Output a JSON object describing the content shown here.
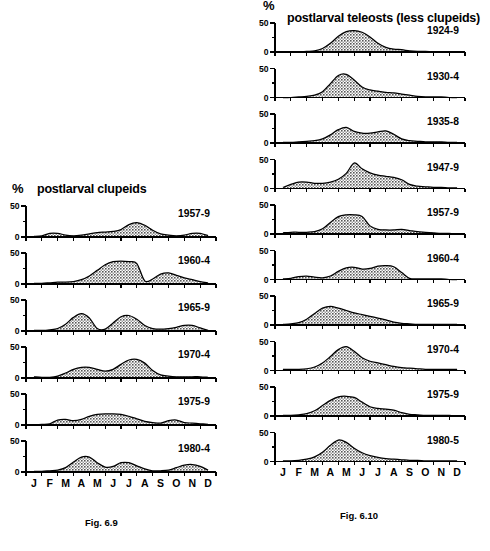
{
  "figure": {
    "background": "#ffffff",
    "ink": "#000000",
    "fill_pattern": "checkered-gray-stipple",
    "fill_color": "#8f8f8f"
  },
  "months": [
    "J",
    "F",
    "M",
    "A",
    "M",
    "J",
    "J",
    "A",
    "S",
    "O",
    "N",
    "D"
  ],
  "y_axis": {
    "min": 0,
    "max": 50,
    "labels": [
      "0",
      "50"
    ],
    "label_values": [
      0,
      50
    ],
    "minor_tick_values": [
      25
    ],
    "unit": "%"
  },
  "left_panel": {
    "percent_symbol": "%",
    "title": "postlarval clupeids",
    "caption": "Fig. 6.9",
    "charts": [
      {
        "label": "1957-9"
      },
      {
        "label": "1960-4"
      },
      {
        "label": "1965-9"
      },
      {
        "label": "1970-4"
      },
      {
        "label": "1975-9"
      },
      {
        "label": "1980-4"
      }
    ]
  },
  "right_panel": {
    "percent_symbol": "%",
    "title": "postlarval teleosts (less clupeids)",
    "caption": "Fig. 6.10",
    "charts": [
      {
        "label": "1924-9"
      },
      {
        "label": "1930-4"
      },
      {
        "label": "1935-8"
      },
      {
        "label": "1947-9"
      },
      {
        "label": "1957-9"
      },
      {
        "label": "1960-4"
      },
      {
        "label": "1965-9"
      },
      {
        "label": "1970-4"
      },
      {
        "label": "1975-9"
      },
      {
        "label": "1980-5"
      }
    ]
  },
  "chart_data": [
    {
      "type": "area",
      "id": "clupeids-1957-9",
      "title": "postlarval clupeids 1957-9",
      "xlabel": "",
      "ylabel": "%",
      "ylim": [
        0,
        50
      ],
      "grid": false,
      "legend": "none",
      "categories": [
        "J",
        "F",
        "M",
        "A",
        "M",
        "J",
        "J",
        "A",
        "S",
        "O",
        "N",
        "D"
      ],
      "x": [
        0,
        0.5,
        1,
        1.5,
        2,
        2.5,
        3,
        3.5,
        4,
        4.5,
        5,
        5.5,
        6,
        6.5,
        7,
        7.5,
        8,
        8.5,
        9,
        9.5,
        10,
        10.5,
        11
      ],
      "values": [
        1,
        2,
        6,
        6,
        3,
        2,
        3,
        5,
        7,
        8,
        9,
        12,
        20,
        23,
        19,
        11,
        5,
        3,
        2,
        3,
        6,
        6,
        2
      ]
    },
    {
      "type": "area",
      "id": "clupeids-1960-4",
      "title": "postlarval clupeids 1960-4",
      "xlabel": "",
      "ylabel": "%",
      "ylim": [
        0,
        50
      ],
      "grid": false,
      "legend": "none",
      "categories": [
        "J",
        "F",
        "M",
        "A",
        "M",
        "J",
        "J",
        "A",
        "S",
        "O",
        "N",
        "D"
      ],
      "x": [
        0,
        0.5,
        1,
        1.5,
        2,
        2.5,
        3,
        3.5,
        4,
        4.5,
        5,
        5.5,
        6,
        6.5,
        7,
        7.5,
        8,
        8.5,
        9,
        9.5,
        10,
        10.5,
        11
      ],
      "values": [
        1,
        1,
        2,
        3,
        3,
        4,
        7,
        13,
        22,
        31,
        36,
        37,
        36,
        33,
        5,
        8,
        16,
        18,
        14,
        10,
        7,
        4,
        2
      ]
    },
    {
      "type": "area",
      "id": "clupeids-1965-9",
      "title": "postlarval clupeids 1965-9",
      "xlabel": "",
      "ylabel": "%",
      "ylim": [
        0,
        50
      ],
      "grid": false,
      "legend": "none",
      "categories": [
        "J",
        "F",
        "M",
        "A",
        "M",
        "J",
        "J",
        "A",
        "S",
        "O",
        "N",
        "D"
      ],
      "x": [
        0,
        0.5,
        1,
        1.5,
        2,
        2.5,
        3,
        3.5,
        4,
        4.5,
        5,
        5.5,
        6,
        6.5,
        7,
        7.5,
        8,
        8.5,
        9,
        9.5,
        10,
        10.5,
        11
      ],
      "values": [
        1,
        1,
        2,
        4,
        11,
        22,
        28,
        21,
        4,
        3,
        13,
        23,
        25,
        19,
        9,
        4,
        3,
        4,
        6,
        9,
        9,
        5,
        1
      ]
    },
    {
      "type": "area",
      "id": "clupeids-1970-4",
      "title": "postlarval clupeids 1970-4",
      "xlabel": "",
      "ylabel": "%",
      "ylim": [
        0,
        50
      ],
      "grid": false,
      "legend": "none",
      "categories": [
        "J",
        "F",
        "M",
        "A",
        "M",
        "J",
        "J",
        "A",
        "S",
        "O",
        "N",
        "D"
      ],
      "x": [
        0,
        0.5,
        1,
        1.5,
        2,
        2.5,
        3,
        3.5,
        4,
        4.5,
        5,
        5.5,
        6,
        6.5,
        7,
        7.5,
        8,
        8.5,
        9,
        9.5,
        10,
        10.5,
        11
      ],
      "values": [
        2,
        1,
        1,
        3,
        8,
        14,
        17,
        17,
        14,
        11,
        14,
        22,
        29,
        30,
        24,
        12,
        5,
        3,
        2,
        2,
        2,
        2,
        1
      ]
    },
    {
      "type": "area",
      "id": "clupeids-1975-9",
      "title": "postlarval clupeids 1975-9",
      "xlabel": "",
      "ylabel": "%",
      "ylim": [
        0,
        50
      ],
      "grid": false,
      "legend": "none",
      "categories": [
        "J",
        "F",
        "M",
        "A",
        "M",
        "J",
        "J",
        "A",
        "S",
        "O",
        "N",
        "D"
      ],
      "x": [
        0,
        0.5,
        1,
        1.5,
        2,
        2.5,
        3,
        3.5,
        4,
        4.5,
        5,
        5.5,
        6,
        6.5,
        7,
        7.5,
        8,
        8.5,
        9,
        9.5,
        10,
        10.5,
        11
      ],
      "values": [
        0,
        1,
        2,
        8,
        9,
        7,
        9,
        14,
        17,
        18,
        18,
        17,
        14,
        10,
        6,
        4,
        3,
        7,
        8,
        4,
        3,
        2,
        1
      ]
    },
    {
      "type": "area",
      "id": "clupeids-1980-4",
      "title": "postlarval clupeids 1980-4",
      "xlabel": "",
      "ylabel": "%",
      "ylim": [
        0,
        50
      ],
      "grid": false,
      "legend": "none",
      "categories": [
        "J",
        "F",
        "M",
        "A",
        "M",
        "J",
        "J",
        "A",
        "S",
        "O",
        "N",
        "D"
      ],
      "x": [
        0,
        0.5,
        1,
        1.5,
        2,
        2.5,
        3,
        3.5,
        4,
        4.5,
        5,
        5.5,
        6,
        6.5,
        7,
        7.5,
        8,
        8.5,
        9,
        9.5,
        10,
        10.5,
        11
      ],
      "values": [
        1,
        1,
        2,
        3,
        7,
        16,
        24,
        24,
        15,
        8,
        9,
        15,
        15,
        10,
        5,
        2,
        2,
        3,
        7,
        11,
        12,
        9,
        3
      ]
    },
    {
      "type": "area",
      "id": "teleosts-1924-9",
      "title": "postlarval teleosts (less clupeids) 1924-9",
      "xlabel": "",
      "ylabel": "%",
      "ylim": [
        0,
        50
      ],
      "grid": false,
      "legend": "none",
      "categories": [
        "J",
        "F",
        "M",
        "A",
        "M",
        "J",
        "J",
        "A",
        "S",
        "O",
        "N",
        "D"
      ],
      "x": [
        0,
        0.5,
        1,
        1.5,
        2,
        2.5,
        3,
        3.5,
        4,
        4.5,
        5,
        5.5,
        6,
        6.5,
        7,
        7.5,
        8,
        8.5,
        9,
        9.5,
        10,
        10.5,
        11
      ],
      "values": [
        0,
        0,
        0,
        1,
        2,
        6,
        15,
        27,
        35,
        37,
        34,
        26,
        15,
        8,
        5,
        4,
        2,
        1,
        1,
        0,
        0,
        0,
        0
      ]
    },
    {
      "type": "area",
      "id": "teleosts-1930-4",
      "title": "postlarval teleosts (less clupeids) 1930-4",
      "xlabel": "",
      "ylabel": "%",
      "ylim": [
        0,
        50
      ],
      "grid": false,
      "legend": "none",
      "categories": [
        "J",
        "F",
        "M",
        "A",
        "M",
        "J",
        "J",
        "A",
        "S",
        "O",
        "N",
        "D"
      ],
      "x": [
        0,
        0.5,
        1,
        1.5,
        2,
        2.5,
        3,
        3.5,
        4,
        4.5,
        5,
        5.5,
        6,
        6.5,
        7,
        7.5,
        8,
        8.5,
        9,
        9.5,
        10,
        10.5,
        11
      ],
      "values": [
        0,
        0,
        1,
        2,
        4,
        10,
        24,
        38,
        40,
        30,
        18,
        13,
        11,
        9,
        8,
        6,
        4,
        2,
        1,
        1,
        1,
        0,
        0
      ]
    },
    {
      "type": "area",
      "id": "teleosts-1935-8",
      "title": "postlarval teleosts (less clupeids) 1935-8",
      "xlabel": "",
      "ylabel": "%",
      "ylim": [
        0,
        50
      ],
      "grid": false,
      "legend": "none",
      "categories": [
        "J",
        "F",
        "M",
        "A",
        "M",
        "J",
        "J",
        "A",
        "S",
        "O",
        "N",
        "D"
      ],
      "x": [
        0,
        0.5,
        1,
        1.5,
        2,
        2.5,
        3,
        3.5,
        4,
        4.5,
        5,
        5.5,
        6,
        6.5,
        7,
        7.5,
        8,
        8.5,
        9,
        9.5,
        10,
        10.5,
        11
      ],
      "values": [
        1,
        1,
        2,
        3,
        4,
        7,
        14,
        23,
        27,
        20,
        17,
        17,
        19,
        21,
        15,
        7,
        4,
        3,
        2,
        2,
        2,
        1,
        1
      ]
    },
    {
      "type": "area",
      "id": "teleosts-1947-9",
      "title": "postlarval teleosts (less clupeids) 1947-9",
      "xlabel": "",
      "ylabel": "%",
      "ylim": [
        0,
        50
      ],
      "grid": false,
      "legend": "none",
      "categories": [
        "J",
        "F",
        "M",
        "A",
        "M",
        "J",
        "J",
        "A",
        "S",
        "O",
        "N",
        "D"
      ],
      "x": [
        0,
        0.5,
        1,
        1.5,
        2,
        2.5,
        3,
        3.5,
        4,
        4.5,
        5,
        5.5,
        6,
        6.5,
        7,
        7.5,
        8,
        8.5,
        9,
        9.5,
        10,
        10.5,
        11
      ],
      "values": [
        2,
        7,
        11,
        11,
        9,
        9,
        11,
        16,
        26,
        44,
        34,
        27,
        23,
        21,
        19,
        15,
        7,
        4,
        3,
        2,
        2,
        1,
        1
      ]
    },
    {
      "type": "area",
      "id": "teleosts-1957-9",
      "title": "postlarval teleosts (less clupeids) 1957-9",
      "xlabel": "",
      "ylabel": "%",
      "ylim": [
        0,
        50
      ],
      "grid": false,
      "legend": "none",
      "categories": [
        "J",
        "F",
        "M",
        "A",
        "M",
        "J",
        "J",
        "A",
        "S",
        "O",
        "N",
        "D"
      ],
      "x": [
        0,
        0.5,
        1,
        1.5,
        2,
        2.5,
        3,
        3.5,
        4,
        4.5,
        5,
        5.5,
        6,
        6.5,
        7,
        7.5,
        8,
        8.5,
        9,
        9.5,
        10,
        10.5,
        11
      ],
      "values": [
        2,
        3,
        3,
        3,
        4,
        9,
        20,
        30,
        33,
        33,
        30,
        14,
        8,
        7,
        7,
        8,
        6,
        4,
        3,
        2,
        1,
        1,
        0
      ]
    },
    {
      "type": "area",
      "id": "teleosts-1960-4",
      "title": "postlarval teleosts (less clupeids) 1960-4",
      "xlabel": "",
      "ylabel": "%",
      "ylim": [
        0,
        50
      ],
      "grid": false,
      "legend": "none",
      "categories": [
        "J",
        "F",
        "M",
        "A",
        "M",
        "J",
        "J",
        "A",
        "S",
        "O",
        "N",
        "D"
      ],
      "x": [
        0,
        0.5,
        1,
        1.5,
        2,
        2.5,
        3,
        3.5,
        4,
        4.5,
        5,
        5.5,
        6,
        6.5,
        7,
        7.5,
        8,
        8.5,
        9,
        9.5,
        10,
        10.5,
        11
      ],
      "values": [
        1,
        2,
        5,
        6,
        4,
        3,
        6,
        14,
        20,
        21,
        18,
        19,
        23,
        24,
        22,
        12,
        2,
        1,
        1,
        1,
        1,
        0,
        0
      ]
    },
    {
      "type": "area",
      "id": "teleosts-1965-9",
      "title": "postlarval teleosts (less clupeids) 1965-9",
      "xlabel": "",
      "ylabel": "%",
      "ylim": [
        0,
        50
      ],
      "grid": false,
      "legend": "none",
      "categories": [
        "J",
        "F",
        "M",
        "A",
        "M",
        "J",
        "J",
        "A",
        "S",
        "O",
        "N",
        "D"
      ],
      "x": [
        0,
        0.5,
        1,
        1.5,
        2,
        2.5,
        3,
        3.5,
        4,
        4.5,
        5,
        5.5,
        6,
        6.5,
        7,
        7.5,
        8,
        8.5,
        9,
        9.5,
        10,
        10.5,
        11
      ],
      "values": [
        1,
        2,
        4,
        10,
        20,
        29,
        32,
        29,
        25,
        21,
        18,
        15,
        12,
        9,
        5,
        3,
        2,
        1,
        1,
        1,
        1,
        1,
        1
      ]
    },
    {
      "type": "area",
      "id": "teleosts-1970-4",
      "title": "postlarval teleosts (less clupeids) 1970-4",
      "xlabel": "",
      "ylabel": "%",
      "ylim": [
        0,
        50
      ],
      "grid": false,
      "legend": "none",
      "categories": [
        "J",
        "F",
        "M",
        "A",
        "M",
        "J",
        "J",
        "A",
        "S",
        "O",
        "N",
        "D"
      ],
      "x": [
        0,
        0.5,
        1,
        1.5,
        2,
        2.5,
        3,
        3.5,
        4,
        4.5,
        5,
        5.5,
        6,
        6.5,
        7,
        7.5,
        8,
        8.5,
        9,
        9.5,
        10,
        10.5,
        11
      ],
      "values": [
        2,
        2,
        2,
        3,
        6,
        13,
        24,
        36,
        41,
        33,
        22,
        16,
        13,
        10,
        7,
        5,
        4,
        3,
        2,
        2,
        2,
        2,
        2
      ]
    },
    {
      "type": "area",
      "id": "teleosts-1975-9",
      "title": "postlarval teleosts (less clupeids) 1975-9",
      "xlabel": "",
      "ylabel": "%",
      "ylim": [
        0,
        50
      ],
      "grid": false,
      "legend": "none",
      "categories": [
        "J",
        "F",
        "M",
        "A",
        "M",
        "J",
        "J",
        "A",
        "S",
        "O",
        "N",
        "D"
      ],
      "x": [
        0,
        0.5,
        1,
        1.5,
        2,
        2.5,
        3,
        3.5,
        4,
        4.5,
        5,
        5.5,
        6,
        6.5,
        7,
        7.5,
        8,
        8.5,
        9,
        9.5,
        10,
        10.5,
        11
      ],
      "values": [
        1,
        1,
        2,
        4,
        9,
        18,
        27,
        33,
        34,
        32,
        24,
        16,
        13,
        12,
        10,
        6,
        3,
        2,
        1,
        1,
        1,
        1,
        0
      ]
    },
    {
      "type": "area",
      "id": "teleosts-1980-5",
      "title": "postlarval teleosts (less clupeids) 1980-5",
      "xlabel": "",
      "ylabel": "%",
      "ylim": [
        0,
        50
      ],
      "grid": false,
      "legend": "none",
      "categories": [
        "J",
        "F",
        "M",
        "A",
        "M",
        "J",
        "J",
        "A",
        "S",
        "O",
        "N",
        "D"
      ],
      "x": [
        0,
        0.5,
        1,
        1.5,
        2,
        2.5,
        3,
        3.5,
        4,
        4.5,
        5,
        5.5,
        6,
        6.5,
        7,
        7.5,
        8,
        8.5,
        9,
        9.5,
        10,
        10.5,
        11
      ],
      "values": [
        1,
        1,
        2,
        4,
        8,
        16,
        28,
        37,
        33,
        23,
        15,
        10,
        7,
        5,
        4,
        3,
        2,
        2,
        1,
        1,
        1,
        1,
        1
      ]
    }
  ]
}
